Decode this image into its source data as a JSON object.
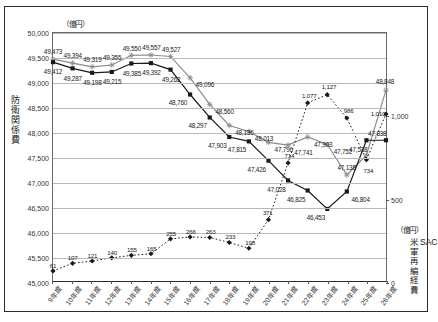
{
  "axes": {
    "left_unit": "（億円）",
    "left_title": "防衛関係費",
    "right_unit": "（億円）",
    "right_title": "米軍再編経費",
    "right_title2": "SACO"
  },
  "chart_data": {
    "type": "line",
    "title": "",
    "xlabel": "",
    "ylabel": "防衛関係費",
    "grid": true,
    "legend": "none",
    "categories": [
      "9年度",
      "10年度",
      "11年度",
      "12年度",
      "13年度",
      "14年度",
      "15年度",
      "16年度",
      "17年度",
      "18年度",
      "19年度",
      "20年度",
      "21年度",
      "22年度",
      "23年度",
      "24年度",
      "25年度",
      "26年度"
    ],
    "y_left_ticks": [
      "45,000",
      "45,500",
      "46,000",
      "46,500",
      "47,000",
      "47,500",
      "48,000",
      "48,500",
      "49,000",
      "49,500",
      "50,000"
    ],
    "ylim": [
      45000,
      50000
    ],
    "y_right_ticks": [
      "0",
      "500",
      "1,000"
    ],
    "y_right_lim": [
      0,
      1500
    ],
    "series": [
      {
        "name": "防衛関係費（SACO・米軍再編経費含む）",
        "axis": "left",
        "marker": "cross",
        "color": "#8c8c8c",
        "values": [
          49473,
          49394,
          49319,
          49355,
          49550,
          49557,
          49527,
          49096,
          48560,
          48136,
          48013,
          47796,
          47741,
          47903,
          47752,
          47138,
          47538,
          48848
        ],
        "labels": [
          "49,473",
          "49,394",
          "49,319",
          "49,355",
          "49,550",
          "49,557",
          "49,527",
          "49,096",
          "48,560",
          "48,136",
          "48,013",
          "47,796",
          "47,741",
          "47,903",
          "47,752",
          "47,138",
          "47,538",
          "48,848"
        ]
      },
      {
        "name": "防衛関係費（SACO・米軍再編経費除く）",
        "axis": "left",
        "marker": "square",
        "color": "#1a1a1a",
        "values": [
          49412,
          49287,
          49198,
          49215,
          49385,
          49392,
          49262,
          48760,
          48297,
          47903,
          47815,
          47426,
          47028,
          46825,
          46453,
          46804,
          47838,
          47838
        ],
        "labels": [
          "49,412",
          "49,287",
          "49,198",
          "49,215",
          "49,385",
          "49,392",
          "49,262",
          "48,760",
          "48,297",
          "47,903",
          "47,815",
          "47,426",
          "47,028",
          "46,825",
          "46,453",
          "46,804",
          "47,838",
          ""
        ]
      },
      {
        "name": "SACO・米軍再編経費",
        "axis": "right",
        "marker": "diamond",
        "color": "#1a1a1a",
        "style": "dotted",
        "values": [
          61,
          107,
          121,
          140,
          155,
          165,
          255,
          266,
          263,
          233,
          198,
          371,
          714,
          1077,
          1127,
          986,
          734,
          1010
        ],
        "labels": [
          "61",
          "107",
          "121",
          "140",
          "155",
          "165",
          "255",
          "266",
          "263",
          "233",
          "198",
          "371",
          "714",
          "1,077",
          "1,127",
          "986",
          "734",
          "1,010"
        ]
      }
    ]
  }
}
